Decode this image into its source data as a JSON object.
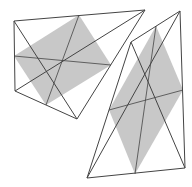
{
  "figure": {
    "width": 192,
    "height": 187,
    "background": "#ffffff",
    "stroke_color": "#444444",
    "fill_color": "#c8c8c8",
    "shapes": [
      {
        "name": "left-quadrilateral",
        "vertices": [
          [
            14,
            21
          ],
          [
            145,
            10
          ],
          [
            77,
            119
          ],
          [
            15,
            91
          ]
        ],
        "varignon_parallelogram": [
          [
            79,
            15
          ],
          [
            111,
            65
          ],
          [
            46,
            105
          ],
          [
            14,
            56
          ]
        ]
      },
      {
        "name": "right-quadrilateral",
        "vertices": [
          [
            131,
            42
          ],
          [
            180,
            11
          ],
          [
            185,
            168
          ],
          [
            87,
            178
          ]
        ],
        "varignon_parallelogram": [
          [
            156,
            26
          ],
          [
            183,
            90
          ],
          [
            135,
            174
          ],
          [
            109,
            110
          ]
        ]
      }
    ]
  }
}
